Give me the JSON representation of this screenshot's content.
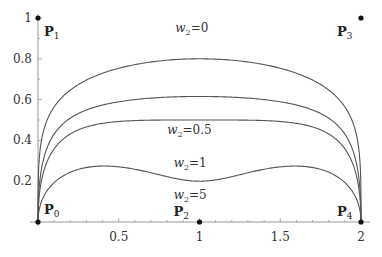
{
  "figure": {
    "control_points": [
      {
        "name": "P",
        "sub": "0",
        "x": 0,
        "y": 0,
        "label_dx": 6,
        "label_dy": -8
      },
      {
        "name": "P",
        "sub": "1",
        "x": 0,
        "y": 1,
        "label_dx": 6,
        "label_dy": 18
      },
      {
        "name": "P",
        "sub": "2",
        "x": 1,
        "y": 0,
        "label_dx": -26,
        "label_dy": -6
      },
      {
        "name": "P",
        "sub": "3",
        "x": 2,
        "y": 1,
        "label_dx": -24,
        "label_dy": 18
      },
      {
        "name": "P",
        "sub": "4",
        "x": 2,
        "y": 0,
        "label_dx": -24,
        "label_dy": -6
      }
    ],
    "curves": [
      {
        "weight": "0",
        "label": "w2=0",
        "label_x": 0.85,
        "label_y": 0.93
      },
      {
        "weight": "0.5",
        "label": "w2=0.5",
        "label_x": 0.8,
        "label_y": 0.43
      },
      {
        "weight": "1",
        "label": "w2=1",
        "label_x": 0.84,
        "label_y": 0.27
      },
      {
        "weight": "5",
        "label": "w2=5",
        "label_x": 0.84,
        "label_y": 0.115
      }
    ],
    "labels": {
      "w_var": "w",
      "w_sub": "2",
      "curve_values": [
        "=0",
        "=0.5",
        "=1",
        "=5"
      ],
      "point_name": "P",
      "point_subs": [
        "0",
        "1",
        "2",
        "3",
        "4"
      ]
    },
    "axes": {
      "x_ticks": [
        "0.5",
        "1",
        "1.5",
        "2"
      ],
      "x_tick_values": [
        0.5,
        1,
        1.5,
        2
      ],
      "y_ticks": [
        "0.2",
        "0.4",
        "0.6",
        "0.8",
        "1"
      ],
      "y_tick_values": [
        0.2,
        0.4,
        0.6,
        0.8,
        1
      ],
      "xlim": [
        0,
        2
      ],
      "ylim": [
        0,
        1
      ]
    },
    "colors": {
      "curve": "#555555",
      "axis": "#999999",
      "point": "#111111"
    }
  }
}
